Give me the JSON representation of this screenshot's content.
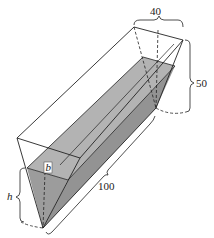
{
  "figure": {
    "type": "trough-diagram",
    "labels": {
      "top_width": "40",
      "depth": "50",
      "length": "100",
      "water_width": "b",
      "water_height": "h"
    },
    "colors": {
      "water_fill": "#a9a9a9",
      "water_fill_dark": "#8f8f8f",
      "stroke": "#222222",
      "background": "#ffffff"
    }
  }
}
